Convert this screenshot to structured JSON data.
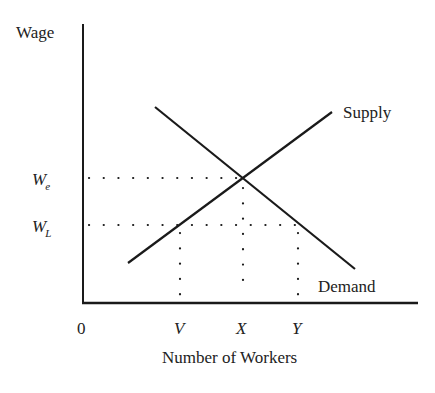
{
  "diagram": {
    "type": "supply-demand",
    "y_axis_label": "Wage",
    "x_axis_label": "Number of Workers",
    "origin_label": "0",
    "wage_levels": [
      {
        "id": "we",
        "label": "W",
        "subscript": "e",
        "y": 178
      },
      {
        "id": "wl",
        "label": "W",
        "subscript": "L",
        "y": 225
      }
    ],
    "worker_levels": [
      {
        "id": "v",
        "label": "V",
        "x": 180
      },
      {
        "id": "x",
        "label": "X",
        "x": 243
      },
      {
        "id": "y",
        "label": "Y",
        "x": 298
      }
    ],
    "curves": {
      "supply": {
        "label": "Supply",
        "x1": 128,
        "y1": 263,
        "x2": 332,
        "y2": 112
      },
      "demand": {
        "label": "Demand",
        "x1": 155,
        "y1": 107,
        "x2": 355,
        "y2": 269
      }
    },
    "colors": {
      "line": "#1a1a1a",
      "text": "#222222",
      "background": "#ffffff"
    }
  }
}
